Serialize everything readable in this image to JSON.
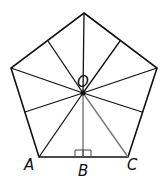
{
  "diagram": {
    "colors": {
      "stroke": "#111111",
      "highlight": "#777777",
      "background": "#ffffff"
    },
    "labels": {
      "center": "O",
      "vertex_a": "A",
      "midpoint_b": "B",
      "vertex_c": "C"
    },
    "vertices": [
      {
        "x": 84,
        "y": 13
      },
      {
        "x": 157,
        "y": 68
      },
      {
        "x": 128,
        "y": 157
      },
      {
        "x": 39,
        "y": 157
      },
      {
        "x": 11,
        "y": 68
      }
    ],
    "center": {
      "x": 83,
      "y": 93
    },
    "midpoints": [
      {
        "x": 120,
        "y": 41
      },
      {
        "x": 142,
        "y": 112
      },
      {
        "x": 83,
        "y": 157
      },
      {
        "x": 25,
        "y": 112
      },
      {
        "x": 48,
        "y": 41
      }
    ],
    "right_angle_marker": "at B"
  }
}
